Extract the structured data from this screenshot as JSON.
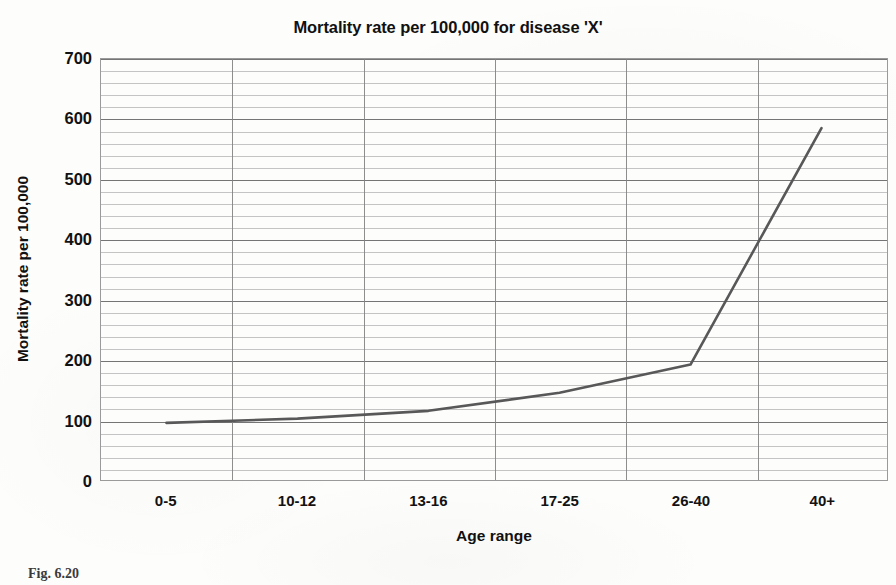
{
  "chart_data": {
    "type": "line",
    "title": "Mortality rate per 100,000 for disease 'X'",
    "xlabel": "Age range",
    "ylabel": "Mortality rate per 100,000",
    "categories": [
      "0-5",
      "10-12",
      "13-16",
      "17-25",
      "26-40",
      "40+"
    ],
    "values": [
      95,
      102,
      115,
      145,
      192,
      585
    ],
    "series": [
      {
        "name": "Mortality rate per 100,000",
        "values": [
          95,
          102,
          115,
          145,
          192,
          585
        ]
      }
    ],
    "ylim": [
      0,
      700
    ],
    "ytick_labels": [
      "0",
      "100",
      "200",
      "300",
      "400",
      "500",
      "600",
      "700"
    ],
    "ytick_values": [
      0,
      100,
      200,
      300,
      400,
      500,
      600,
      700
    ],
    "y_major_interval": 100,
    "y_minor_interval": 20,
    "grid": "horizontal-major-and-minor-plus-vertical-category",
    "legend": "none",
    "line_color": "#585858",
    "plot_background": "#fdfdfc",
    "gridline_color": "#9a9a9a",
    "markers": "none"
  },
  "figure": {
    "caption_fragment": "Fig. 6.20"
  }
}
